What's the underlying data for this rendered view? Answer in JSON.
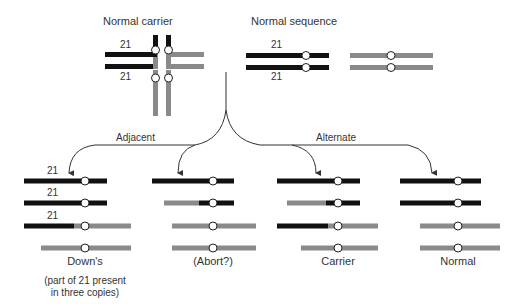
{
  "colors": {
    "chr21": "#111111",
    "other": "#8a8a8a",
    "centromere_fill": "#ffffff",
    "centromere_stroke": "#222222",
    "line": "#333333",
    "text": "#333333"
  },
  "titles": {
    "carrier": "Normal carrier",
    "sequence": "Normal sequence"
  },
  "branches": {
    "adjacent": "Adjacent",
    "alternate": "Alternate"
  },
  "chromosome_label": "21",
  "outcomes": [
    {
      "label": "Down's",
      "note_lines": [
        "(part of 21 present",
        "in three copies)"
      ],
      "chromosome_labels": [
        "21",
        "21",
        "21"
      ],
      "center_x": 85,
      "rows": [
        {
          "segments": [
            {
              "x1": 24,
              "x2": 107,
              "color": "chr21"
            }
          ]
        },
        {
          "segments": [
            {
              "x1": 24,
              "x2": 107,
              "color": "chr21"
            }
          ]
        },
        {
          "segments": [
            {
              "x1": 24,
              "x2": 74,
              "color": "chr21"
            },
            {
              "x1": 74,
              "x2": 131,
              "color": "other"
            }
          ]
        },
        {
          "segments": [
            {
              "x1": 41,
              "x2": 131,
              "color": "other"
            }
          ]
        }
      ]
    },
    {
      "label": "(Abort?)",
      "note_lines": [],
      "chromosome_labels": [],
      "center_x": 213,
      "rows": [
        {
          "segments": [
            {
              "x1": 152,
              "x2": 234,
              "color": "chr21"
            }
          ]
        },
        {
          "segments": [
            {
              "x1": 164,
              "x2": 199,
              "color": "other"
            },
            {
              "x1": 199,
              "x2": 234,
              "color": "chr21"
            }
          ]
        },
        {
          "segments": [
            {
              "x1": 172,
              "x2": 256,
              "color": "other"
            }
          ]
        },
        {
          "segments": [
            {
              "x1": 172,
              "x2": 256,
              "color": "other"
            }
          ]
        }
      ]
    },
    {
      "label": "Carrier",
      "note_lines": [],
      "chromosome_labels": [],
      "center_x": 338,
      "rows": [
        {
          "segments": [
            {
              "x1": 277,
              "x2": 360,
              "color": "chr21"
            }
          ]
        },
        {
          "segments": [
            {
              "x1": 287,
              "x2": 326,
              "color": "other"
            },
            {
              "x1": 326,
              "x2": 360,
              "color": "chr21"
            }
          ]
        },
        {
          "segments": [
            {
              "x1": 277,
              "x2": 328,
              "color": "chr21"
            },
            {
              "x1": 328,
              "x2": 378,
              "color": "other"
            }
          ]
        },
        {
          "segments": [
            {
              "x1": 301,
              "x2": 378,
              "color": "other"
            }
          ]
        }
      ]
    },
    {
      "label": "Normal",
      "note_lines": [],
      "chromosome_labels": [],
      "center_x": 458,
      "rows": [
        {
          "segments": [
            {
              "x1": 400,
              "x2": 481,
              "color": "chr21"
            }
          ]
        },
        {
          "segments": [
            {
              "x1": 400,
              "x2": 481,
              "color": "chr21"
            }
          ]
        },
        {
          "segments": [
            {
              "x1": 420,
              "x2": 500,
              "color": "other"
            }
          ]
        },
        {
          "segments": [
            {
              "x1": 420,
              "x2": 500,
              "color": "other"
            }
          ]
        }
      ]
    }
  ]
}
